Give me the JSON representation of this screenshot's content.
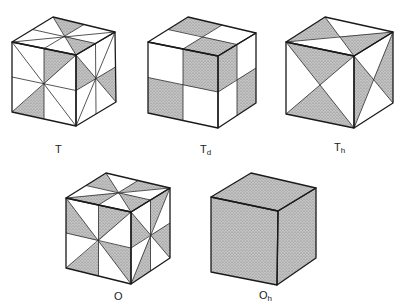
{
  "figure": {
    "cubes": [
      {
        "id": "T",
        "label_main": "T",
        "label_sub": "",
        "pattern": "T"
      },
      {
        "id": "Td",
        "label_main": "T",
        "label_sub": "d",
        "pattern": "Td"
      },
      {
        "id": "Th",
        "label_main": "T",
        "label_sub": "h",
        "pattern": "Th"
      },
      {
        "id": "O",
        "label_main": "O",
        "label_sub": "",
        "pattern": "O"
      },
      {
        "id": "Oh",
        "label_main": "O",
        "label_sub": "h",
        "pattern": "Oh"
      }
    ],
    "colors": {
      "shade": "#a9a9a9",
      "line": "#1a1a1a",
      "background": "#ffffff"
    }
  }
}
